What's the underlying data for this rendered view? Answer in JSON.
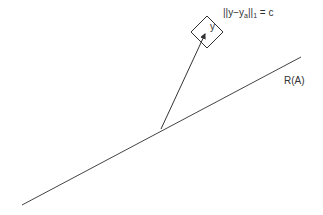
{
  "diagram": {
    "line_label": "R(A)",
    "vector_label": "y",
    "equation": {
      "prefix": "||y−y",
      "sub_a": "a",
      "mid": "||",
      "sub_1": "1",
      "suffix": " = c"
    },
    "colors": {
      "stroke": "#333333",
      "background": "#ffffff"
    },
    "geometry": {
      "range_line": {
        "x1": 22,
        "y1": 205,
        "x2": 301,
        "y2": 57
      },
      "vector": {
        "x1": 161,
        "y1": 129,
        "x2": 206,
        "y2": 32
      },
      "l1_ball_center": [
        207,
        32
      ],
      "l1_ball_radius": 16
    }
  }
}
